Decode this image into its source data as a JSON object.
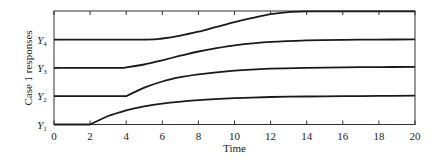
{
  "chart_data": {
    "type": "line",
    "title": "",
    "xlabel": "Time",
    "ylabel": "Case 1 responses",
    "xlim": [
      0,
      20
    ],
    "xticks": [
      0,
      2,
      4,
      6,
      8,
      10,
      12,
      14,
      16,
      18,
      20
    ],
    "ytick_labels": [
      {
        "base": "Y",
        "sub": "1"
      },
      {
        "base": "Y",
        "sub": "2"
      },
      {
        "base": "Y",
        "sub": "3"
      },
      {
        "base": "Y",
        "sub": "4"
      }
    ],
    "grid": false,
    "legend": null,
    "series": [
      {
        "name": "Y1",
        "baseline_level": 0,
        "x": [
          0,
          2,
          3,
          4,
          5,
          6,
          8,
          10,
          12,
          14,
          16,
          18,
          20
        ],
        "y": [
          0,
          0,
          0.3,
          0.5,
          0.64,
          0.74,
          0.86,
          0.93,
          0.97,
          0.99,
          1.0,
          1.01,
          1.02
        ]
      },
      {
        "name": "Y2",
        "baseline_level": 1,
        "x": [
          0,
          4,
          5,
          6,
          7,
          8,
          10,
          12,
          14,
          16,
          18,
          20
        ],
        "y": [
          0,
          0,
          0.3,
          0.52,
          0.67,
          0.77,
          0.9,
          0.97,
          1.0,
          1.02,
          1.03,
          1.04
        ]
      },
      {
        "name": "Y3",
        "baseline_level": 2,
        "x": [
          0,
          3.5,
          4,
          5,
          6,
          7,
          8,
          9,
          10,
          11,
          12,
          14,
          16,
          18,
          20
        ],
        "y": [
          0,
          0,
          0.02,
          0.12,
          0.27,
          0.43,
          0.58,
          0.7,
          0.8,
          0.87,
          0.92,
          0.97,
          0.99,
          1.0,
          1.01
        ]
      },
      {
        "name": "Y4",
        "baseline_level": 3,
        "x": [
          0,
          5,
          6,
          7,
          8,
          9,
          10,
          11,
          12,
          13,
          14,
          16,
          18,
          20
        ],
        "y": [
          0,
          0,
          0.04,
          0.14,
          0.28,
          0.45,
          0.62,
          0.77,
          0.9,
          0.97,
          1.0,
          1.0,
          1.0,
          1.0
        ]
      }
    ]
  }
}
